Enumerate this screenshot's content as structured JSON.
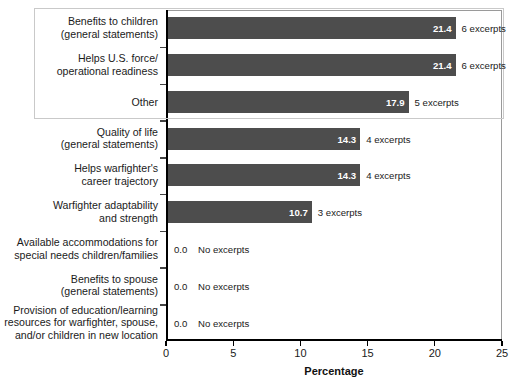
{
  "chart_data": {
    "type": "bar",
    "orientation": "horizontal",
    "title": "",
    "xlabel": "Percentage",
    "ylabel": "",
    "xlim": [
      0,
      25
    ],
    "xticks": [
      0,
      5,
      10,
      15,
      20,
      25
    ],
    "xtick_labels": [
      "0",
      "5",
      "10",
      "15",
      "20",
      "25"
    ],
    "grid": false,
    "legend": null,
    "bar_color": "#4d4d4d",
    "value_label_color": "#ffffff",
    "highlight_box_color": "#c9c9c9",
    "highlighted_categories": [
      "Benefits to children (general statements)",
      "Helps U.S. force/operational readiness",
      "Other"
    ],
    "categories": [
      "Benefits to children\n(general statements)",
      "Helps U.S. force/\noperational readiness",
      "Other",
      "Quality of life\n(general statements)",
      "Helps warfighter's\ncareer trajectory",
      "Warfighter adaptability\nand strength",
      "Available accommodations for\nspecial needs children/families",
      "Benefits to spouse\n(general statements)",
      "Provision of education/learning\nresources for warfighter, spouse,\nand/or children in new location"
    ],
    "values": [
      21.4,
      21.4,
      17.9,
      14.3,
      14.3,
      10.7,
      0.0,
      0.0,
      0.0
    ],
    "value_labels": [
      "21.4",
      "21.4",
      "17.9",
      "14.3",
      "14.3",
      "10.7",
      "0.0",
      "0.0",
      "0.0"
    ],
    "annotations": [
      "6 excerpts",
      "6 excerpts",
      "5 excerpts",
      "4 excerpts",
      "4 excerpts",
      "3 excerpts",
      "No excerpts",
      "No excerpts",
      "No excerpts"
    ]
  },
  "rows": [
    {
      "label_lines": [
        "Benefits to children",
        "(general statements)"
      ],
      "value": 21.4,
      "value_label": "21.4",
      "annotation": "6 excerpts",
      "is_zero": false
    },
    {
      "label_lines": [
        "Helps U.S. force/",
        "operational readiness"
      ],
      "value": 21.4,
      "value_label": "21.4",
      "annotation": "6 excerpts",
      "is_zero": false
    },
    {
      "label_lines": [
        "Other"
      ],
      "value": 17.9,
      "value_label": "17.9",
      "annotation": "5 excerpts",
      "is_zero": false
    },
    {
      "label_lines": [
        "Quality of life",
        "(general statements)"
      ],
      "value": 14.3,
      "value_label": "14.3",
      "annotation": "4 excerpts",
      "is_zero": false
    },
    {
      "label_lines": [
        "Helps warfighter's",
        "career trajectory"
      ],
      "value": 14.3,
      "value_label": "14.3",
      "annotation": "4 excerpts",
      "is_zero": false
    },
    {
      "label_lines": [
        "Warfighter adaptability",
        "and strength"
      ],
      "value": 10.7,
      "value_label": "10.7",
      "annotation": "3 excerpts",
      "is_zero": false
    },
    {
      "label_lines": [
        "Available accommodations for",
        "special needs children/families"
      ],
      "value": 0.0,
      "value_label": "0.0",
      "annotation": "No excerpts",
      "is_zero": true
    },
    {
      "label_lines": [
        "Benefits to spouse",
        "(general statements)"
      ],
      "value": 0.0,
      "value_label": "0.0",
      "annotation": "No excerpts",
      "is_zero": true
    },
    {
      "label_lines": [
        "Provision of education/learning",
        "resources for warfighter, spouse,",
        "and/or children in new location"
      ],
      "value": 0.0,
      "value_label": "0.0",
      "annotation": "No excerpts",
      "is_zero": true
    }
  ],
  "axis": {
    "x_title": "Percentage",
    "ticks": [
      "0",
      "5",
      "10",
      "15",
      "20",
      "25"
    ]
  }
}
